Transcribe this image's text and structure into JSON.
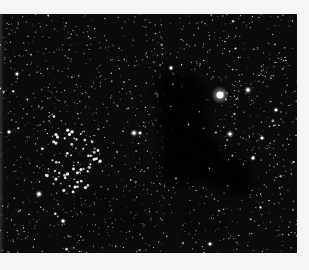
{
  "image": {
    "subject": "Star field with dark nebula and open star cluster",
    "background_color": "#f5f5f5",
    "sky_color": "#0b0b0b",
    "frame": {
      "x": 0,
      "y": 14,
      "width": 297,
      "height": 239
    },
    "seed": 86,
    "field_star_count": 1400,
    "bright_stars": [
      {
        "x": 220,
        "y": 81,
        "r": 3.6,
        "glow": 9
      },
      {
        "x": 248,
        "y": 76,
        "r": 1.8,
        "glow": 4
      },
      {
        "x": 230,
        "y": 120,
        "r": 1.6,
        "glow": 4
      },
      {
        "x": 253,
        "y": 144,
        "r": 1.5,
        "glow": 3
      },
      {
        "x": 262,
        "y": 124,
        "r": 1.3,
        "glow": 3
      },
      {
        "x": 171,
        "y": 54,
        "r": 1.4,
        "glow": 3
      },
      {
        "x": 134,
        "y": 119,
        "r": 1.7,
        "glow": 4
      },
      {
        "x": 39,
        "y": 180,
        "r": 1.8,
        "glow": 4
      },
      {
        "x": 63,
        "y": 207,
        "r": 1.5,
        "glow": 3
      },
      {
        "x": 276,
        "y": 96,
        "r": 1.3,
        "glow": 3
      },
      {
        "x": 17,
        "y": 60,
        "r": 1.2,
        "glow": 3
      },
      {
        "x": 9,
        "y": 118,
        "r": 1.3,
        "glow": 3
      },
      {
        "x": 140,
        "y": 119,
        "r": 1.2,
        "glow": 3
      },
      {
        "x": 210,
        "y": 230,
        "r": 1.3,
        "glow": 3
      }
    ],
    "cluster": {
      "cx": 72,
      "cy": 146,
      "rx": 30,
      "ry": 32,
      "count": 60
    },
    "dark_nebula": {
      "path": "M160,62 C178,52 200,58 206,76 C212,94 204,108 214,122 C224,136 238,140 246,150 C256,162 258,176 246,182 C232,188 222,178 210,172 C196,166 186,176 174,174 C160,172 156,158 160,144 C164,128 156,112 158,96 C160,82 150,70 160,62 Z",
      "opacity": 0.92
    },
    "faint_dust": [
      {
        "cx": 110,
        "cy": 200,
        "rx": 40,
        "ry": 22,
        "opacity": 0.35
      },
      {
        "cx": 200,
        "cy": 200,
        "rx": 30,
        "ry": 18,
        "opacity": 0.3
      }
    ]
  }
}
